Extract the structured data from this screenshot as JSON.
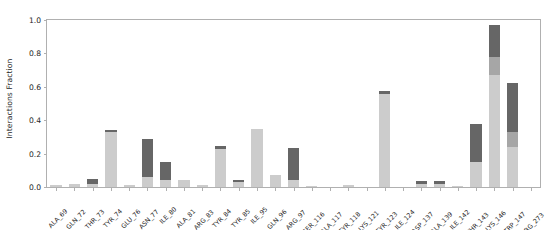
{
  "chart_data": {
    "type": "bar",
    "title": "",
    "xlabel": "",
    "ylabel": "Interactions Fraction",
    "ylim": [
      0.0,
      1.0
    ],
    "yticks": [
      0.0,
      0.2,
      0.4,
      0.6,
      0.8,
      1.0
    ],
    "ytick_labels": [
      "0.0",
      "0.2",
      "0.4",
      "0.6",
      "0.8",
      "1.0"
    ],
    "grid": false,
    "legend": "none",
    "stacked": true,
    "bar_color_light": "#cccccc",
    "bar_color_medium": "#a6a6a6",
    "bar_color_dark": "#666666",
    "axis_color": "#b0b0b0",
    "text_color": "#262626",
    "background": "#ffffff",
    "categories": [
      "ALA_69",
      "GLN_72",
      "THR_73",
      "TYR_74",
      "GLU_76",
      "ASN_77",
      "ILE_80",
      "ALA_81",
      "ARG_83",
      "TYR_84",
      "TYR_85",
      "ILE_95",
      "GLN_96",
      "ARG_97",
      "SER_116",
      "ALA_117",
      "TYR_118",
      "LYS_121",
      "TYR_123",
      "ILE_124",
      "ASP_137",
      "ALA_139",
      "ILE_142",
      "THR_143",
      "LYS_146",
      "TRP_147",
      "ARG_273"
    ],
    "series": [
      {
        "name": "light",
        "color": "#cccccc",
        "values": [
          0.01,
          0.02,
          0.02,
          0.33,
          0.01,
          0.06,
          0.04,
          0.04,
          0.01,
          0.23,
          0.03,
          0.35,
          0.07,
          0.04,
          0.005,
          0.0,
          0.01,
          0.0,
          0.555,
          0.0,
          0.02,
          0.02,
          0.005,
          0.15,
          0.67,
          0.24,
          0.0
        ]
      },
      {
        "name": "medium",
        "color": "#a6a6a6",
        "values": [
          0.0,
          0.0,
          0.0,
          0.0,
          0.0,
          0.0,
          0.0,
          0.0,
          0.0,
          0.0,
          0.0,
          0.0,
          0.0,
          0.0,
          0.0,
          0.0,
          0.0,
          0.0,
          0.0,
          0.0,
          0.0,
          0.0,
          0.0,
          0.0,
          0.11,
          0.09,
          0.0
        ]
      },
      {
        "name": "dark",
        "color": "#666666",
        "values": [
          0.005,
          0.0,
          0.03,
          0.01,
          0.0,
          0.23,
          0.11,
          0.0,
          0.005,
          0.015,
          0.01,
          0.0,
          0.0,
          0.195,
          0.0,
          0.0,
          0.0,
          0.0,
          0.02,
          0.0,
          0.015,
          0.015,
          0.0,
          0.225,
          0.19,
          0.29,
          0.0
        ]
      }
    ],
    "totals": [
      0.015,
      0.02,
      0.05,
      0.34,
      0.01,
      0.29,
      0.15,
      0.04,
      0.015,
      0.245,
      0.04,
      0.35,
      0.07,
      0.235,
      0.005,
      0.0,
      0.01,
      0.0,
      0.575,
      0.0,
      0.035,
      0.035,
      0.005,
      0.375,
      0.97,
      0.62,
      0.0
    ]
  }
}
